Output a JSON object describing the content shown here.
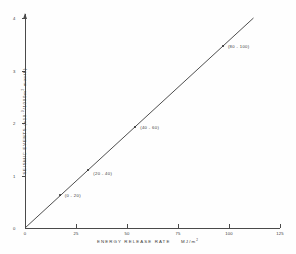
{
  "chart_data": {
    "type": "line",
    "title": "",
    "xlabel": "ENERGY RELEASE RATE  MJ/m2",
    "ylabel": "SEISMIC EVENTS  (x10-3/1000m2 month)",
    "xlim": [
      0,
      125
    ],
    "ylim": [
      0,
      4
    ],
    "grid": false,
    "legend": null,
    "x_ticks": [
      {
        "value": 0,
        "label": "0"
      },
      {
        "value": 25,
        "label": "25"
      },
      {
        "value": 50,
        "label": "50"
      },
      {
        "value": 75,
        "label": "75"
      },
      {
        "value": 100,
        "label": "100"
      },
      {
        "value": 125,
        "label": "125"
      }
    ],
    "y_ticks": [
      {
        "value": 0,
        "label": "0"
      },
      {
        "value": 1,
        "label": "1"
      },
      {
        "value": 2,
        "label": "2"
      },
      {
        "value": 3,
        "label": "3"
      },
      {
        "value": 4,
        "label": "4"
      }
    ],
    "line": {
      "from": {
        "x": 0,
        "y": 0
      },
      "to": {
        "x": 112,
        "y": 4.0
      },
      "color": "#3a3a3a"
    },
    "points": [
      {
        "x": 17,
        "y": 0.62,
        "label": "(0 - 20)"
      },
      {
        "x": 31,
        "y": 1.1,
        "label": "(20 - 40)"
      },
      {
        "x": 54,
        "y": 1.93,
        "label": "(40 - 60)"
      },
      {
        "x": 97,
        "y": 3.46,
        "label": "(80 - 100)"
      }
    ]
  },
  "axis_text": {
    "x_label_main": "ENERGY   RELEASE   RATE",
    "x_label_unit": "MJ/m",
    "x_label_unit_sup": "2",
    "y_label_main": "SEISMIC  EVENTS  (x10",
    "y_label_sup1": "-3",
    "y_label_mid": "/1000m",
    "y_label_sup2": "2",
    "y_label_end": " month)"
  }
}
